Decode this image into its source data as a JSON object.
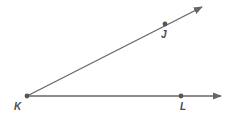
{
  "diagram": {
    "type": "angle",
    "vertex": {
      "label": "K",
      "x": 27,
      "y": 96
    },
    "rays": [
      {
        "name": "ray-KJ",
        "from": "K",
        "through": {
          "label": "J",
          "x": 165,
          "y": 24
        },
        "tip": {
          "x": 202,
          "y": 7
        }
      },
      {
        "name": "ray-KL",
        "from": "K",
        "through": {
          "label": "L",
          "x": 181,
          "y": 96
        },
        "tip": {
          "x": 221,
          "y": 96
        }
      }
    ],
    "labels": {
      "K": "K",
      "J": "J",
      "L": "L"
    },
    "colors": {
      "line": "#666666",
      "point": "#555555",
      "label": "#4a4a4a"
    }
  }
}
